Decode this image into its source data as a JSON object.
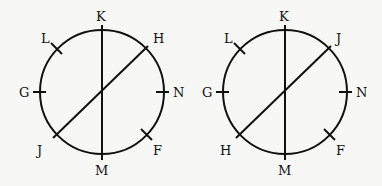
{
  "diagrams": [
    {
      "id": "left",
      "center": [
        102,
        92
      ],
      "radius": 62,
      "labels": {
        "top": "K",
        "upper_left": "L",
        "upper_right": "H",
        "left": "G",
        "right": "N",
        "lower_left": "J",
        "lower_right": "F",
        "bottom": "M"
      },
      "chords": [
        "K-M",
        "H-J"
      ]
    },
    {
      "id": "right",
      "center": [
        285,
        92
      ],
      "radius": 62,
      "labels": {
        "top": "K",
        "upper_left": "L",
        "upper_right": "J",
        "left": "G",
        "right": "N",
        "lower_left": "H",
        "lower_right": "F",
        "bottom": "M"
      },
      "chords": [
        "K-M",
        "J-H"
      ]
    }
  ],
  "colors": {
    "stroke": "#111111",
    "background": "#f7f7f5"
  }
}
